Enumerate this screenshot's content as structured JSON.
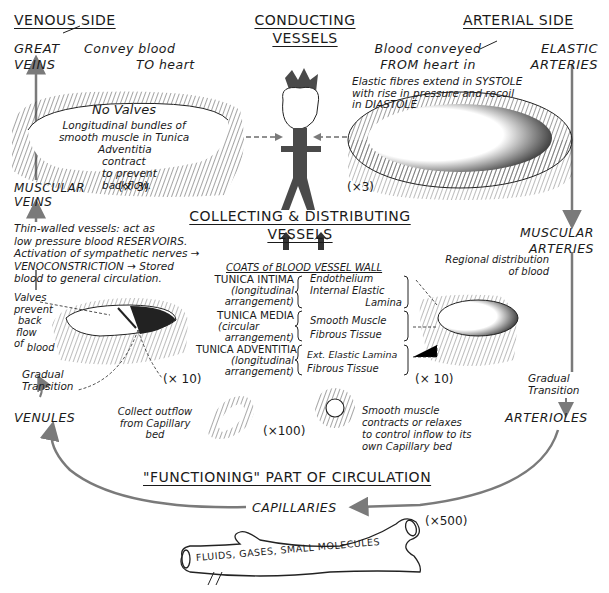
{
  "headers": {
    "venous_side": "VENOUS SIDE",
    "conducting_1": "CONDUCTING",
    "conducting_2": "VESSELS",
    "arterial_side": "ARTERIAL SIDE",
    "collecting_1": "COLLECTING & DISTRIBUTING",
    "collecting_2": "VESSELS",
    "functioning": "\"FUNCTIONING\" PART OF CIRCULATION"
  },
  "venous": {
    "great_veins": [
      "GREAT",
      "VEINS"
    ],
    "great_veins_note": [
      "Convey blood",
      "TO heart"
    ],
    "muscular_veins": [
      "MUSCULAR",
      "VEINS"
    ],
    "no_valves_title": "No Valves",
    "no_valves_note": [
      "Longitudinal bundles of",
      "smooth muscle in Tunica",
      "Adventitia",
      "contract",
      "to prevent",
      "backflow."
    ],
    "reservoir_note": [
      "Thin-walled vessels: act as",
      "low pressure blood RESERVOIRS.",
      "Activation of sympathetic nerves →",
      "VENOCONSTRICTION → Stored",
      "blood to general circulation."
    ],
    "valves_note": [
      "Valves",
      "prevent",
      "back",
      "flow",
      "of",
      "blood"
    ],
    "gradual_transition": [
      "Gradual",
      "Transition"
    ],
    "venules": "VENULES",
    "venules_note": [
      "Collect outflow",
      "from Capillary",
      "bed"
    ]
  },
  "arterial": {
    "elastic_arteries": [
      "ELASTIC",
      "ARTERIES"
    ],
    "elastic_note": [
      "Blood conveyed",
      "FROM heart in"
    ],
    "elastic_fibres_note": [
      "Elastic fibres extend in SYSTOLE",
      "with rise in pressure and recoil",
      "in DIASTOLE"
    ],
    "muscular_arteries": [
      "MUSCULAR",
      "ARTERIES"
    ],
    "regional_note": [
      "Regional distribution",
      "of blood"
    ],
    "gradual_transition": [
      "Gradual",
      "Transition"
    ],
    "arterioles": "ARTERIOLES",
    "arterioles_note": [
      "Smooth muscle",
      "contracts or relaxes",
      "to control inflow to its",
      "own Capillary bed"
    ]
  },
  "magnifications": {
    "great_vein": "(× 3)",
    "elastic_artery": "(×3)",
    "muscular_vein": "(× 10)",
    "muscular_artery": "(× 10)",
    "venule": "(×100)",
    "capillary": "(×500)"
  },
  "coats": {
    "title": "COATS of BLOOD VESSEL WALL",
    "items": [
      {
        "name": "TUNICA INTIMA",
        "sub": [
          "(longitudinal",
          "arrangement)"
        ],
        "layers": [
          "Endothelium",
          "Internal Elastic",
          "Lamina"
        ]
      },
      {
        "name": "TUNICA MEDIA",
        "sub": [
          "(circular",
          "arrangement)"
        ],
        "layers": [
          "Smooth Muscle",
          "Fibrous Tissue"
        ]
      },
      {
        "name": "TUNICA ADVENTITIA",
        "sub": [
          "(longitudinal",
          "arrangement)"
        ],
        "layers": [
          "Ext. Elastic Lamina",
          "Fibrous Tissue"
        ]
      }
    ]
  },
  "capillaries": {
    "label": "CAPILLARIES",
    "tube_text": "FLUIDS, GASES, SMALL MOLECULES"
  },
  "colors": {
    "ink": "#1a1a1a",
    "arrow_gray": "#7a7a7a",
    "heart_gray": "#4a4a4a"
  }
}
